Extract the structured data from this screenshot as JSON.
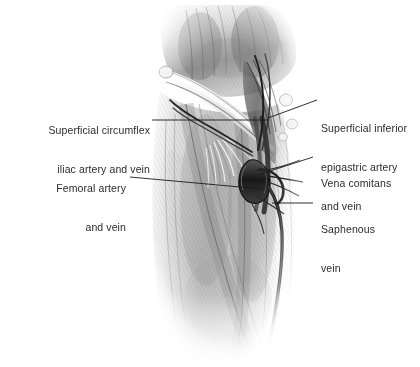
{
  "figure": {
    "kind": "anatomical-illustration",
    "style": "grayscale graphite pencil rendering",
    "background_color": "#ffffff",
    "text_color": "#2b2b2b",
    "leader_color": "#1a1a1a"
  },
  "labels": {
    "superficial_circumflex": {
      "line1": "Superficial circumflex",
      "line2": "iliac artery and vein"
    },
    "femoral": {
      "line1": "Femoral artery",
      "line2": "and vein"
    },
    "superficial_inferior_epigastric": {
      "line1": "Superficial inferior",
      "line2": "epigastric artery",
      "line3": "and vein"
    },
    "vena_comitans": {
      "line1": "Vena comitans"
    },
    "saphenous": {
      "line1": "Saphenous",
      "line2": "vein"
    }
  }
}
